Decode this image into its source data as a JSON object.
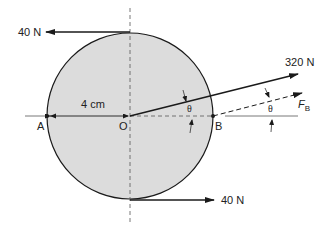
{
  "diagram": {
    "title": "",
    "labels": {
      "force_top": "40 N",
      "force_bottom": "40 N",
      "force_angled": "320 N",
      "force_b_main": "F",
      "force_b_sub": "B",
      "radius": "4 cm",
      "point_a": "A",
      "point_o": "O",
      "point_b": "B",
      "angle_1": "θ",
      "angle_2": "θ"
    },
    "colors": {
      "disk_fill": "#dcdcdc",
      "line": "#1a1a1a",
      "background": "#ffffff"
    }
  }
}
